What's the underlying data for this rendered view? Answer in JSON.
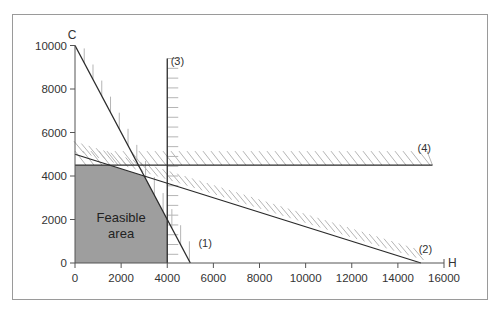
{
  "chart_data": {
    "type": "line",
    "title": "",
    "xlabel": "H",
    "ylabel": "C",
    "xlim": [
      0,
      16000
    ],
    "ylim": [
      0,
      10000
    ],
    "x_ticks": [
      0,
      2000,
      4000,
      6000,
      8000,
      10000,
      12000,
      14000,
      16000
    ],
    "y_ticks": [
      0,
      2000,
      4000,
      6000,
      8000,
      10000
    ],
    "x_tick_labels": [
      "0",
      "2000",
      "4000",
      "6000",
      "8000",
      "10000",
      "12000",
      "14000",
      "16000"
    ],
    "y_tick_labels": [
      "0",
      "2000",
      "4000",
      "6000",
      "8000",
      "10000"
    ],
    "grid": false,
    "constraints": [
      {
        "name": "(1)",
        "points": [
          [
            0,
            10000
          ],
          [
            5000,
            0
          ]
        ],
        "hatch_side": "outside"
      },
      {
        "name": "(2)",
        "points": [
          [
            0,
            5000
          ],
          [
            15000,
            0
          ]
        ],
        "hatch_side": "outside"
      },
      {
        "name": "(3)",
        "points": [
          [
            4000,
            0
          ],
          [
            4000,
            9400
          ]
        ],
        "hatch_side": "outside"
      },
      {
        "name": "(4)",
        "points": [
          [
            0,
            4500
          ],
          [
            15500,
            4500
          ]
        ],
        "hatch_side": "outside"
      }
    ],
    "feasible_region": {
      "label": "Feasible area",
      "label_lines": [
        "Feasible",
        "area"
      ],
      "vertices": [
        [
          0,
          0
        ],
        [
          0,
          4500
        ],
        [
          1500,
          4500
        ],
        [
          3000,
          4000
        ],
        [
          4000,
          2000
        ],
        [
          4000,
          0
        ]
      ],
      "color": "#9e9e9e"
    },
    "colors": {
      "lines": "#2a2a2a",
      "hatch": "#b5b5b5",
      "axis": "#555555"
    }
  }
}
